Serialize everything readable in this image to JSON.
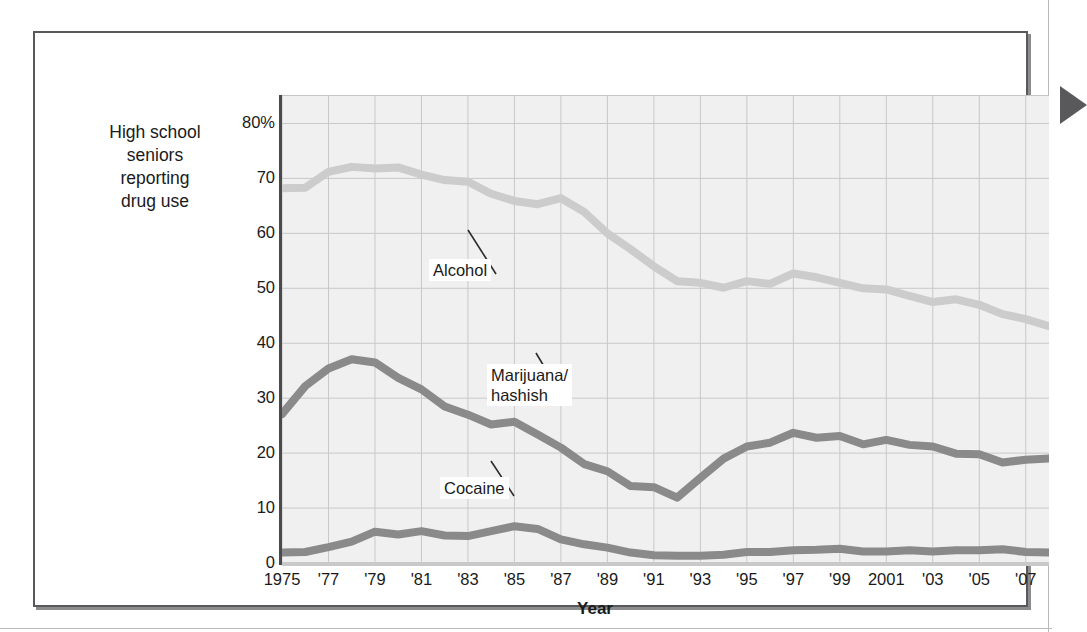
{
  "figure": {
    "y_axis_title": "High school\nseniors\nreporting\ndrug use",
    "x_axis_title": "Year",
    "arrow_icon": "triangle-right-icon"
  },
  "chart_data": {
    "type": "line",
    "title": "",
    "xlabel": "Year",
    "ylabel": "High school seniors reporting drug use",
    "xlim": [
      1975,
      2008
    ],
    "ylim": [
      0,
      85
    ],
    "grid": true,
    "legend": "inline-callouts",
    "ytick_labels": [
      "80%",
      "70",
      "60",
      "50",
      "40",
      "30",
      "20",
      "10",
      "0"
    ],
    "ytick_values": [
      80,
      70,
      60,
      50,
      40,
      30,
      20,
      10,
      0
    ],
    "xtick_labels": [
      "1975",
      "'77",
      "'79",
      "'81",
      "'83",
      "'85",
      "'87",
      "'89",
      "'91",
      "'93",
      "'95",
      "'97",
      "'99",
      "2001",
      "'03",
      "'05",
      "'07"
    ],
    "xtick_values": [
      1975,
      1977,
      1979,
      1981,
      1983,
      1985,
      1987,
      1989,
      1991,
      1993,
      1995,
      1997,
      1999,
      2001,
      2003,
      2005,
      2007
    ],
    "x": [
      1975,
      1976,
      1977,
      1978,
      1979,
      1980,
      1981,
      1982,
      1983,
      1984,
      1985,
      1986,
      1987,
      1988,
      1989,
      1990,
      1991,
      1992,
      1993,
      1994,
      1995,
      1996,
      1997,
      1998,
      1999,
      2000,
      2001,
      2002,
      2003,
      2004,
      2005,
      2006,
      2007,
      2008
    ],
    "series": [
      {
        "name": "Alcohol",
        "color": "#cccccc",
        "label": "Alcohol",
        "values": [
          68.2,
          68.3,
          71.2,
          72.1,
          71.8,
          72.0,
          70.7,
          69.7,
          69.4,
          67.2,
          65.9,
          65.3,
          66.4,
          63.9,
          60.0,
          57.1,
          54.0,
          51.3,
          51.0,
          50.1,
          51.3,
          50.8,
          52.7,
          52.0,
          51.0,
          50.0,
          49.8,
          48.6,
          47.5,
          48.0,
          47.0,
          45.3,
          44.4,
          43.1
        ]
      },
      {
        "name": "Marijuana/hashish",
        "color": "#8a8a8a",
        "label": "Marijuana/\nhashish",
        "values": [
          27.1,
          32.2,
          35.4,
          37.1,
          36.5,
          33.7,
          31.6,
          28.5,
          27.0,
          25.2,
          25.7,
          23.4,
          21.0,
          18.0,
          16.7,
          14.0,
          13.8,
          11.9,
          15.5,
          19.0,
          21.2,
          21.9,
          23.7,
          22.8,
          23.1,
          21.6,
          22.4,
          21.5,
          21.2,
          19.9,
          19.8,
          18.3,
          18.8,
          19.0
        ]
      },
      {
        "name": "Cocaine",
        "color": "#8a8a8a",
        "label": "Cocaine",
        "values": [
          1.9,
          2.0,
          2.9,
          3.9,
          5.7,
          5.2,
          5.8,
          5.0,
          4.9,
          5.8,
          6.7,
          6.2,
          4.3,
          3.4,
          2.8,
          1.9,
          1.4,
          1.3,
          1.3,
          1.5,
          2.0,
          2.0,
          2.3,
          2.4,
          2.6,
          2.1,
          2.1,
          2.3,
          2.1,
          2.3,
          2.3,
          2.5,
          2.0,
          1.9
        ]
      }
    ]
  }
}
